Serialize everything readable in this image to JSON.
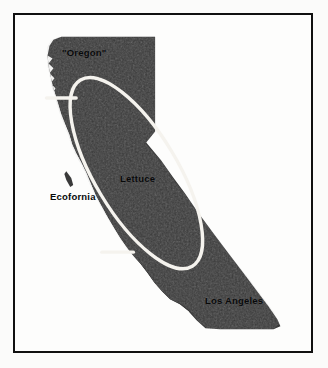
{
  "figure": {
    "labels": [
      {
        "id": "oregon",
        "text": "\"Oregon\""
      },
      {
        "id": "ecofornia",
        "text": "Ecofornia"
      },
      {
        "id": "lettuce",
        "text": "Lettuce"
      },
      {
        "id": "los_angeles",
        "text": "Los Angeles"
      }
    ],
    "colors": {
      "land_fill": "#3a3a3a",
      "land_fill_dark": "#303030",
      "overlay_line": "#f5f3ee",
      "frame_border": "#101010",
      "page_background": "#ffffff",
      "label_text": "#08090a"
    },
    "regions": {
      "north_label": "\"Oregon\"",
      "central_valley_label": "Lettuce",
      "coast_label": "Ecofornia",
      "south_label": "Los Angeles"
    }
  }
}
